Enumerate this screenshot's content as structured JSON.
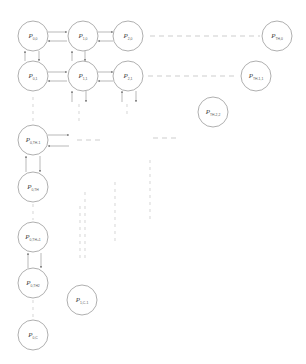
{
  "diagram": {
    "type": "processor-grid",
    "colors": {
      "node_stroke": "#9a9a9a",
      "arrow": "#8a8a8a",
      "dashed": "#b8b8b8"
    },
    "nodes": [
      {
        "id": "p00",
        "main": "P",
        "sub": "0,0",
        "x": 33,
        "y": 36
      },
      {
        "id": "p10",
        "main": "P",
        "sub": "1,0",
        "x": 83,
        "y": 36
      },
      {
        "id": "p20",
        "main": "P",
        "sub": "2,0",
        "x": 128,
        "y": 36
      },
      {
        "id": "pth0",
        "main": "P",
        "sub": "TH,0",
        "x": 277,
        "y": 36
      },
      {
        "id": "p01",
        "main": "P",
        "sub": "0,1",
        "x": 33,
        "y": 76
      },
      {
        "id": "p11",
        "main": "P",
        "sub": "1,1",
        "x": 83,
        "y": 76
      },
      {
        "id": "p21",
        "main": "P",
        "sub": "2,1",
        "x": 128,
        "y": 76
      },
      {
        "id": "pth11",
        "main": "P",
        "sub": "TH-1,1",
        "x": 256,
        "y": 76
      },
      {
        "id": "pth22",
        "main": "P",
        "sub": "TH-2,2",
        "x": 213,
        "y": 112
      },
      {
        "id": "p0thm1",
        "main": "P",
        "sub": "0,TH-1",
        "x": 33,
        "y": 140
      },
      {
        "id": "p0th",
        "main": "P",
        "sub": "0,TH",
        "x": 33,
        "y": 187
      },
      {
        "id": "p0thp1",
        "main": "P",
        "sub": "0,TH+1",
        "x": 33,
        "y": 237
      },
      {
        "id": "p0th2",
        "main": "P",
        "sub": "0,TH2",
        "x": 33,
        "y": 283
      },
      {
        "id": "p1cm1",
        "main": "P",
        "sub": "1,C-1",
        "x": 82,
        "y": 300
      },
      {
        "id": "p0c",
        "main": "P",
        "sub": "0,C",
        "x": 33,
        "y": 335
      }
    ]
  }
}
